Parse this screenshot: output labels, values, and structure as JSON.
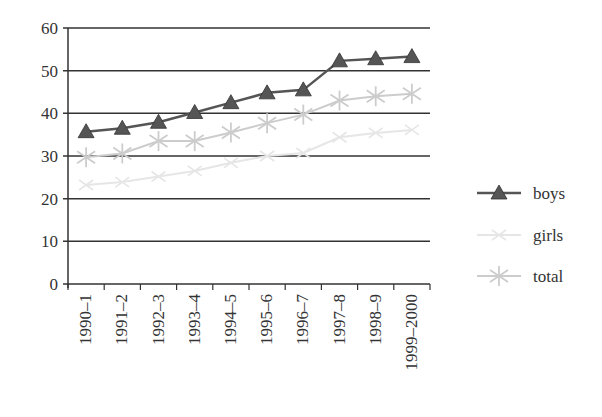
{
  "chart_data": {
    "type": "line",
    "title": "",
    "xlabel": "",
    "ylabel": "",
    "ylim": [
      0,
      60
    ],
    "yticks": [
      0,
      10,
      20,
      30,
      40,
      50,
      60
    ],
    "grid": true,
    "legend_position": "right",
    "categories": [
      "1990–1",
      "1991–2",
      "1992–3",
      "1993–4",
      "1994–5",
      "1995–6",
      "1996–7",
      "1997–8",
      "1998–9",
      "1999–2000"
    ],
    "series": [
      {
        "name": "boys",
        "marker": "triangle",
        "color": "#555555",
        "values": [
          35.7,
          36.5,
          37.9,
          40.2,
          42.5,
          44.8,
          45.5,
          52.3,
          52.8,
          53.3
        ]
      },
      {
        "name": "girls",
        "marker": "x",
        "color": "#e6e6e6",
        "values": [
          23.2,
          23.9,
          25.2,
          26.5,
          28.4,
          30.0,
          30.7,
          34.4,
          35.4,
          36.1
        ]
      },
      {
        "name": "total",
        "marker": "asterisk",
        "color": "#cccccc",
        "values": [
          29.7,
          30.6,
          33.5,
          33.5,
          35.5,
          37.7,
          39.7,
          43.0,
          44.0,
          44.6
        ]
      }
    ]
  },
  "legend": {
    "items": [
      {
        "label": "boys"
      },
      {
        "label": "girls"
      },
      {
        "label": "total"
      }
    ]
  }
}
